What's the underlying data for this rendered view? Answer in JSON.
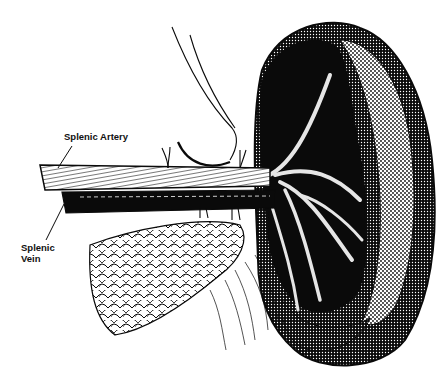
{
  "figure": {
    "colors": {
      "ink": "#0a0a0a",
      "paper": "#ffffff"
    }
  },
  "labels": {
    "splenic_artery": "Splenic Artery",
    "splenic_vein_line1": "Splenic",
    "splenic_vein_line2": "Vein"
  }
}
